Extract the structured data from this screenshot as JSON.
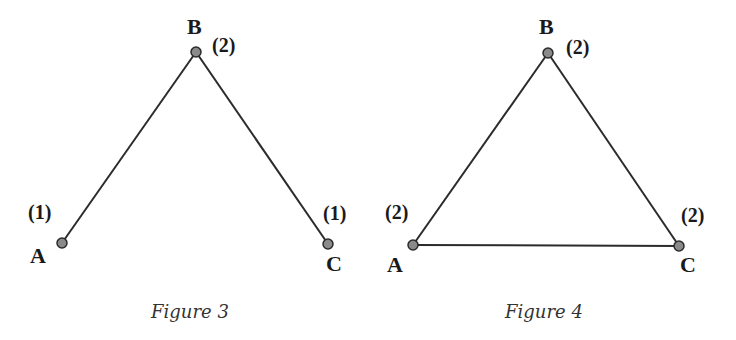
{
  "figures": [
    {
      "caption": "Figure 3",
      "nodes": [
        {
          "id": "A",
          "label": "A",
          "degree_label": "(1)",
          "x": 62,
          "y": 243
        },
        {
          "id": "B",
          "label": "B",
          "degree_label": "(2)",
          "x": 196,
          "y": 52
        },
        {
          "id": "C",
          "label": "C",
          "degree_label": "(1)",
          "x": 328,
          "y": 244
        }
      ],
      "edges": [
        [
          "A",
          "B"
        ],
        [
          "B",
          "C"
        ]
      ]
    },
    {
      "caption": "Figure 4",
      "nodes": [
        {
          "id": "A",
          "label": "A",
          "degree_label": "(2)",
          "x": 413,
          "y": 245
        },
        {
          "id": "B",
          "label": "B",
          "degree_label": "(2)",
          "x": 548,
          "y": 53
        },
        {
          "id": "C",
          "label": "C",
          "degree_label": "(2)",
          "x": 679,
          "y": 246
        }
      ],
      "edges": [
        [
          "A",
          "B"
        ],
        [
          "B",
          "C"
        ],
        [
          "A",
          "C"
        ]
      ]
    }
  ],
  "colors": {
    "edge": "#2b2b2b",
    "node_fill": "#8a8a8a",
    "text": "#1a1a1a"
  }
}
